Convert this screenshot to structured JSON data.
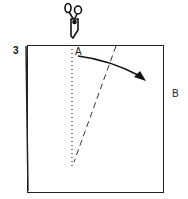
{
  "diagram": {
    "step_number": "3",
    "point_a_label": "A",
    "point_b_label": "B",
    "icons": [
      "scissors-icon"
    ],
    "elements": [
      "paper-square",
      "dotted-cut-line",
      "dashed-fold-line",
      "curved-arrow"
    ]
  }
}
